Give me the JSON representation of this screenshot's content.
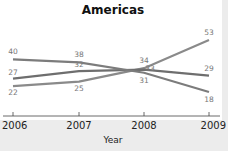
{
  "chart_data": {
    "type": "line",
    "title": "Americas",
    "xlabel": "Year",
    "ylabel": "",
    "x": [
      "2006",
      "2007",
      "2008",
      "2009"
    ],
    "series": [
      {
        "name": "Series A",
        "values": [
          22,
          25,
          34,
          53
        ],
        "color": "#8a8a8a"
      },
      {
        "name": "Series B",
        "values": [
          27,
          32,
          33,
          29
        ],
        "color": "#6e6e6e"
      },
      {
        "name": "Series C",
        "values": [
          40,
          38,
          31,
          18
        ],
        "color": "#7c7c7c"
      }
    ],
    "grid": false,
    "legend": "none"
  }
}
